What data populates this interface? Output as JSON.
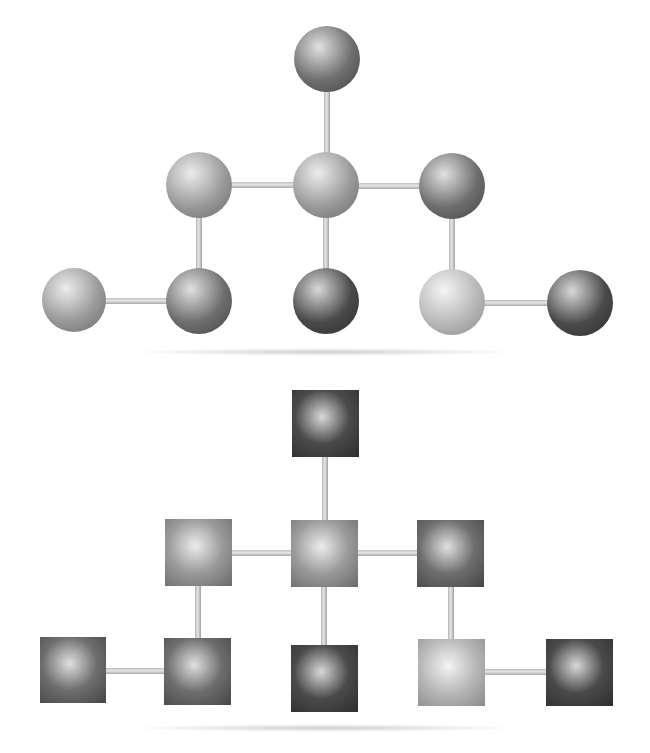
{
  "diagram": {
    "colors": {
      "background": "#ffffff",
      "bond": "#c8c8c8",
      "shade_dark": "#4a4a4a",
      "shade_medium": "#6e6e6e",
      "shade_light": "#9a9a9a",
      "shade_lightest": "#b8b8b8"
    },
    "panels": [
      {
        "id": "spheres",
        "shape": "sphere",
        "nodes": [
          {
            "id": "top",
            "cx": 327,
            "cy": 59,
            "r": 33,
            "tone": "medium"
          },
          {
            "id": "mid-left",
            "cx": 199,
            "cy": 185,
            "r": 33,
            "tone": "light"
          },
          {
            "id": "mid-center",
            "cx": 326,
            "cy": 185,
            "r": 33,
            "tone": "light"
          },
          {
            "id": "mid-right",
            "cx": 452,
            "cy": 186,
            "r": 33,
            "tone": "medium"
          },
          {
            "id": "bot-far-left",
            "cx": 74,
            "cy": 300,
            "r": 32,
            "tone": "light"
          },
          {
            "id": "bot-left",
            "cx": 199,
            "cy": 301,
            "r": 33,
            "tone": "medium"
          },
          {
            "id": "bot-center",
            "cx": 326,
            "cy": 301,
            "r": 33,
            "tone": "dark"
          },
          {
            "id": "bot-right",
            "cx": 452,
            "cy": 302,
            "r": 33,
            "tone": "lightest"
          },
          {
            "id": "bot-far-right",
            "cx": 580,
            "cy": 303,
            "r": 33,
            "tone": "dark"
          }
        ],
        "edges": [
          [
            "top",
            "mid-center"
          ],
          [
            "mid-left",
            "mid-center"
          ],
          [
            "mid-center",
            "mid-right"
          ],
          [
            "mid-left",
            "bot-left"
          ],
          [
            "mid-center",
            "bot-center"
          ],
          [
            "mid-right",
            "bot-right"
          ],
          [
            "bot-far-left",
            "bot-left"
          ],
          [
            "bot-right",
            "bot-far-right"
          ]
        ]
      },
      {
        "id": "cubes",
        "shape": "square",
        "nodes": [
          {
            "id": "top",
            "cx": 325,
            "cy": 423,
            "size": 67,
            "tone": "dark"
          },
          {
            "id": "mid-left",
            "cx": 198,
            "cy": 552,
            "size": 67,
            "tone": "light"
          },
          {
            "id": "mid-center",
            "cx": 324,
            "cy": 553,
            "size": 67,
            "tone": "light"
          },
          {
            "id": "mid-right",
            "cx": 450,
            "cy": 553,
            "size": 67,
            "tone": "medium"
          },
          {
            "id": "bot-far-left",
            "cx": 73,
            "cy": 670,
            "size": 66,
            "tone": "medium"
          },
          {
            "id": "bot-left",
            "cx": 197,
            "cy": 671,
            "size": 67,
            "tone": "medium"
          },
          {
            "id": "bot-center",
            "cx": 324,
            "cy": 678,
            "size": 67,
            "tone": "dark"
          },
          {
            "id": "bot-right",
            "cx": 451,
            "cy": 672,
            "size": 67,
            "tone": "lightest"
          },
          {
            "id": "bot-far-right",
            "cx": 579,
            "cy": 672,
            "size": 67,
            "tone": "dark"
          }
        ],
        "edges": [
          [
            "top",
            "mid-center"
          ],
          [
            "mid-left",
            "mid-center"
          ],
          [
            "mid-center",
            "mid-right"
          ],
          [
            "mid-left",
            "bot-left"
          ],
          [
            "mid-center",
            "bot-center"
          ],
          [
            "mid-right",
            "bot-right"
          ],
          [
            "bot-far-left",
            "bot-left"
          ],
          [
            "bot-right",
            "bot-far-right"
          ]
        ]
      }
    ]
  }
}
